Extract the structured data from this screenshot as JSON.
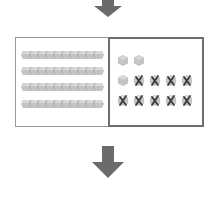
{
  "diagram": {
    "tens_rods": {
      "count": 4,
      "cubes_per_rod": 10
    },
    "ones_units": {
      "total": 14,
      "crossed_out": 9,
      "remaining": 5,
      "rows": [
        [
          "plain",
          "plain"
        ],
        [
          "plain",
          "crossed",
          "crossed",
          "crossed",
          "crossed"
        ],
        [
          "crossed",
          "crossed",
          "crossed",
          "crossed",
          "crossed"
        ]
      ]
    },
    "arrows": [
      "down-arrow-top",
      "down-arrow-bottom"
    ],
    "colors": {
      "arrow": "#6b6b6b",
      "block_fill": "#c4c4c4",
      "block_dark": "#a9a9a9",
      "cross": "#3a3a3a",
      "left_border": "#9a9a9a",
      "right_border": "#6e6e6e"
    }
  }
}
